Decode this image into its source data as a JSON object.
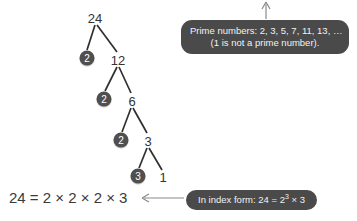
{
  "diagram": {
    "title_text": "Prime factor tree for 24",
    "tree": {
      "nodes": [
        {
          "id": "n24",
          "label": "24",
          "type": "plain",
          "x": 95,
          "y": 18
        },
        {
          "id": "p2a",
          "label": "2",
          "type": "circled",
          "x": 87,
          "y": 58
        },
        {
          "id": "n12",
          "label": "12",
          "type": "plain",
          "x": 118,
          "y": 60
        },
        {
          "id": "p2b",
          "label": "2",
          "type": "circled",
          "x": 104,
          "y": 99
        },
        {
          "id": "n6",
          "label": "6",
          "type": "plain",
          "x": 132,
          "y": 101
        },
        {
          "id": "p2c",
          "label": "2",
          "type": "circled",
          "x": 121,
          "y": 140
        },
        {
          "id": "n3",
          "label": "3",
          "type": "plain",
          "x": 148,
          "y": 141
        },
        {
          "id": "p3",
          "label": "3",
          "type": "circled",
          "x": 138,
          "y": 176
        },
        {
          "id": "n1",
          "label": "1",
          "type": "plain",
          "x": 163,
          "y": 177
        }
      ],
      "edges": [
        {
          "from": "n24",
          "to": "p2a"
        },
        {
          "from": "n24",
          "to": "n12"
        },
        {
          "from": "n12",
          "to": "p2b"
        },
        {
          "from": "n12",
          "to": "n6"
        },
        {
          "from": "n6",
          "to": "p2c"
        },
        {
          "from": "n6",
          "to": "n3"
        },
        {
          "from": "n3",
          "to": "p3"
        },
        {
          "from": "n3",
          "to": "n1"
        }
      ]
    },
    "equation": "24 = 2 × 2 × 2 × 3",
    "callout_prime": {
      "line1": "Prime numbers: 2, 3, 5, 7, 11, 13, …",
      "line2": "(1 is not a prime number)."
    },
    "callout_index": {
      "prefix": "In index form: 24 = 2",
      "exponent": "3",
      "suffix": " × 3"
    },
    "colors": {
      "bubble": "#4a4a4a",
      "bubble_text": "#f2f2f2",
      "node_circle": "#4f4f4f",
      "node_circle_text": "#ffffff",
      "line": "#2f2f2f",
      "arrow": "#8a8a8a",
      "text": "#333333",
      "background": "#ffffff"
    }
  }
}
